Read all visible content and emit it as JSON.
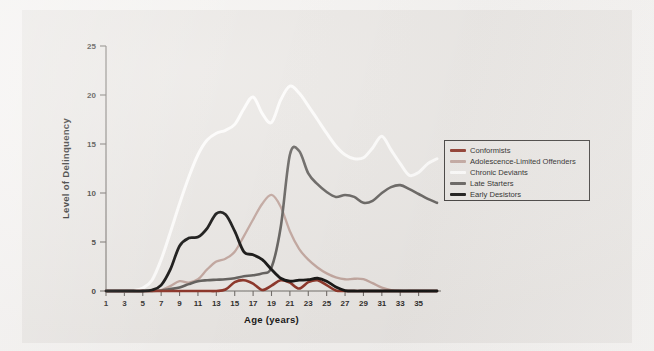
{
  "figure": {
    "background_color": "#f4f2f0",
    "panel_color": "#e9e6e3"
  },
  "legend": {
    "position": "right-middle",
    "entries": [
      {
        "label": "Conformists",
        "color": "#8a3023",
        "swatch": "legend-swatch-conformists"
      },
      {
        "label": "Adolescence-Limited Offenders",
        "color": "#c0a49c",
        "swatch": "legend-swatch-adolescence-limited"
      },
      {
        "label": "Chronic Deviants",
        "color": "#fdfcfb",
        "swatch": "legend-swatch-chronic-deviants"
      },
      {
        "label": "Late Starters",
        "color": "#5f5c59",
        "swatch": "legend-swatch-late-starters"
      },
      {
        "label": "Early Desistors",
        "color": "#100f0e",
        "swatch": "legend-swatch-early-desistors"
      }
    ]
  },
  "chart_data": {
    "type": "line",
    "title": "",
    "xlabel": "Age (years)",
    "ylabel": "Level of Delinquency",
    "xlim": [
      1,
      37
    ],
    "ylim": [
      0,
      25
    ],
    "xticks": [
      1,
      3,
      5,
      7,
      9,
      11,
      13,
      15,
      17,
      19,
      21,
      23,
      25,
      27,
      29,
      31,
      33,
      35
    ],
    "xtick_labels": [
      "1",
      "3",
      "5",
      "7",
      "9",
      "11",
      "13",
      "15",
      "17",
      "19",
      "21",
      "23",
      "25",
      "27",
      "29",
      "31",
      "33",
      "35"
    ],
    "yticks": [
      0,
      5,
      10,
      15,
      20,
      25
    ],
    "ytick_labels": [
      "0",
      "5",
      "10",
      "15",
      "20",
      "25"
    ],
    "grid": false,
    "x": [
      1,
      2,
      3,
      4,
      5,
      6,
      7,
      8,
      9,
      10,
      11,
      12,
      13,
      14,
      15,
      16,
      17,
      18,
      19,
      20,
      21,
      22,
      23,
      24,
      25,
      26,
      27,
      28,
      29,
      30,
      31,
      32,
      33,
      34,
      35,
      36,
      37
    ],
    "series": [
      {
        "name": "Conformists",
        "color": "#8a3023",
        "linewidth": 2.6,
        "values": [
          0,
          0,
          0,
          0,
          0,
          0,
          0,
          0,
          0,
          0,
          0,
          0,
          0,
          0.15,
          0.9,
          1.1,
          0.75,
          0.1,
          0.55,
          1.1,
          0.85,
          0.25,
          0.9,
          1.1,
          0.6,
          0.05,
          0,
          0,
          0,
          0,
          0,
          0,
          0,
          0,
          0,
          0,
          0
        ]
      },
      {
        "name": "Adolescence-Limited Offenders",
        "color": "#c0a49c",
        "linewidth": 2.3,
        "values": [
          0,
          0,
          0,
          0,
          0,
          0,
          0.1,
          0.5,
          1.0,
          0.85,
          1.2,
          2.2,
          3.0,
          3.3,
          4.0,
          5.6,
          7.3,
          8.9,
          9.8,
          8.6,
          6.1,
          4.3,
          3.2,
          2.4,
          1.8,
          1.4,
          1.2,
          1.25,
          1.2,
          0.8,
          0.35,
          0.1,
          0,
          0,
          0,
          0,
          0
        ]
      },
      {
        "name": "Chronic Deviants",
        "color": "#fdfcfb",
        "linewidth": 3.0,
        "values": [
          0,
          0,
          0,
          0.05,
          0.3,
          1.1,
          3.2,
          6.0,
          8.9,
          11.6,
          13.9,
          15.4,
          16.1,
          16.4,
          17.0,
          18.6,
          19.8,
          18.1,
          17.2,
          19.5,
          20.9,
          20.2,
          18.9,
          17.5,
          16.1,
          14.8,
          13.9,
          13.5,
          13.6,
          14.6,
          15.8,
          14.4,
          13.0,
          11.8,
          12.1,
          13.0,
          13.5
        ]
      },
      {
        "name": "Late Starters",
        "color": "#5f5c59",
        "linewidth": 2.6,
        "values": [
          0,
          0,
          0,
          0,
          0,
          0,
          0.05,
          0.2,
          0.35,
          0.7,
          1.0,
          1.1,
          1.15,
          1.2,
          1.3,
          1.5,
          1.6,
          1.8,
          2.4,
          6.5,
          13.9,
          14.3,
          12.0,
          10.9,
          10.1,
          9.6,
          9.8,
          9.6,
          9.0,
          9.2,
          10.0,
          10.6,
          10.8,
          10.4,
          9.9,
          9.4,
          9.0
        ]
      },
      {
        "name": "Early Desistors",
        "color": "#100f0e",
        "linewidth": 2.8,
        "values": [
          0,
          0,
          0,
          0,
          0,
          0.1,
          0.6,
          2.2,
          4.6,
          5.4,
          5.5,
          6.4,
          7.9,
          7.8,
          6.1,
          4.0,
          3.7,
          3.2,
          2.2,
          1.3,
          1.0,
          1.1,
          1.15,
          1.3,
          1.0,
          0.4,
          0.05,
          0,
          0,
          0,
          0,
          0,
          0,
          0,
          0,
          0,
          0
        ]
      }
    ]
  }
}
